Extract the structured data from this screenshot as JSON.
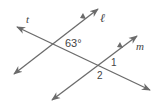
{
  "figure": {
    "line_color": "#6b6b6b",
    "text_color": "#444444",
    "lines": [
      {
        "name": "t",
        "x1": 17,
        "y1": 27,
        "x2": 150,
        "y2": 90,
        "arrow_start": true,
        "arrow_end": true,
        "parallel_marks": false
      },
      {
        "name": "l",
        "x1": 14,
        "y1": 74,
        "x2": 98,
        "y2": 9,
        "arrow_start": true,
        "arrow_end": true,
        "parallel_marks": true
      },
      {
        "name": "m",
        "x1": 52,
        "y1": 100,
        "x2": 137,
        "y2": 36,
        "arrow_start": true,
        "arrow_end": true,
        "parallel_marks": true
      }
    ],
    "labels": {
      "t": "t",
      "l": "ℓ",
      "m": "m",
      "angle_given": "63°",
      "angle_1": "1",
      "angle_2": "2"
    }
  }
}
